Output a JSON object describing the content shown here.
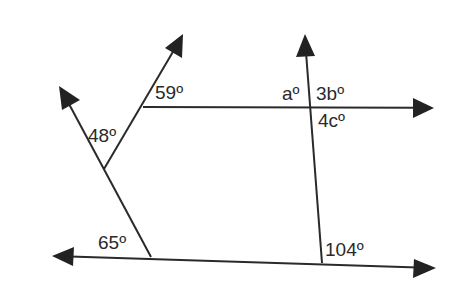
{
  "diagram": {
    "type": "geometry-angles",
    "colors": {
      "line": "#2a2a2a",
      "arrowhead": "#222222",
      "text": "#2a2a2a",
      "background": "#ffffff"
    },
    "labels": {
      "angle_59": "59º",
      "angle_48": "48º",
      "angle_65": "65º",
      "angle_104": "104º",
      "angle_a": "aº",
      "angle_3b": "3bº",
      "angle_4c": "4cº"
    },
    "lines": [
      {
        "name": "bottom-line",
        "from": [
          52,
          256
        ],
        "to": [
          435,
          268
        ],
        "arrows": "both"
      },
      {
        "name": "left-transversal",
        "from": [
          151,
          257
        ],
        "to": [
          60,
          88
        ],
        "arrows": "end"
      },
      {
        "name": "branch-ray",
        "from": [
          104,
          169
        ],
        "to": [
          182,
          36
        ],
        "arrows": "end"
      },
      {
        "name": "top-ray",
        "from": [
          143,
          107
        ],
        "to": [
          432,
          108
        ],
        "arrows": "end"
      },
      {
        "name": "vertical-transversal",
        "from": [
          322,
          263
        ],
        "to": [
          305,
          36
        ],
        "arrows": "end"
      }
    ]
  }
}
